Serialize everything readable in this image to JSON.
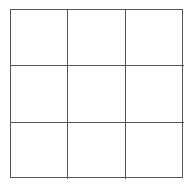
{
  "board": {
    "rows": 3,
    "cols": 3,
    "line_color": "#555555",
    "cells": [
      [
        "",
        "",
        ""
      ],
      [
        "",
        "",
        ""
      ],
      [
        "",
        "",
        ""
      ]
    ]
  }
}
